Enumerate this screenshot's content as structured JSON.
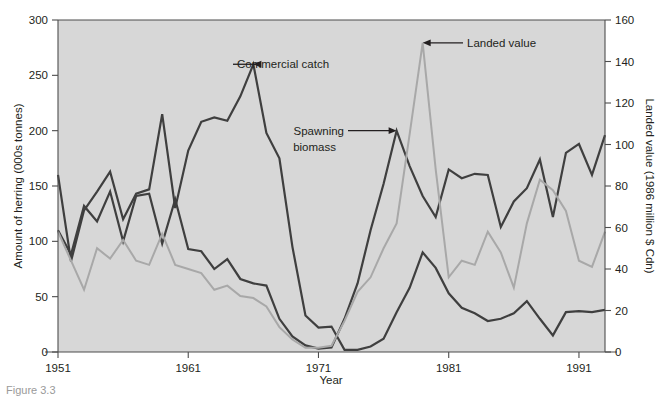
{
  "figure": {
    "caption": "Figure 3.3",
    "plot_bg_color": "#d7d7d7",
    "axis_color": "#4d4d4d"
  },
  "chart_data": {
    "type": "line",
    "title": "",
    "xlabel": "Year",
    "ylabel": "Amount of herring (000s tonnes)",
    "y2label": "Landed value (1986 million $ Cdn)",
    "xlim": [
      1951,
      1993
    ],
    "ylim": [
      0,
      300
    ],
    "y2lim": [
      0,
      160
    ],
    "grid": false,
    "legend": "annotations",
    "xticks": [
      1951,
      1961,
      1971,
      1981,
      1991
    ],
    "xticklabels": [
      "1951",
      "1961",
      "1971",
      "1981",
      "1991"
    ],
    "yticks": [
      0,
      50,
      100,
      150,
      200,
      250,
      300
    ],
    "yticklabels": [
      "0",
      "50",
      "100",
      "150",
      "200",
      "250",
      "300"
    ],
    "y2ticks": [
      0,
      20,
      40,
      60,
      80,
      100,
      120,
      140,
      160
    ],
    "y2ticklabels": [
      "0",
      "20",
      "40",
      "60",
      "80",
      "100",
      "120",
      "140",
      "160"
    ],
    "x": [
      1951,
      1952,
      1953,
      1954,
      1955,
      1956,
      1957,
      1958,
      1959,
      1960,
      1961,
      1962,
      1963,
      1964,
      1965,
      1966,
      1967,
      1968,
      1969,
      1970,
      1971,
      1972,
      1973,
      1974,
      1975,
      1976,
      1977,
      1978,
      1979,
      1980,
      1981,
      1982,
      1983,
      1984,
      1985,
      1986,
      1987,
      1988,
      1989,
      1990,
      1991,
      1992,
      1993
    ],
    "series": [
      {
        "name": "Commercial catch",
        "axis": "left",
        "color": "#3f3f3f",
        "width": 2.2,
        "values": [
          160,
          82,
          128,
          145,
          163,
          120,
          143,
          147,
          215,
          130,
          182,
          208,
          212,
          209,
          231,
          260,
          198,
          175,
          95,
          33,
          22,
          23,
          2,
          2,
          5,
          12,
          36,
          58,
          90,
          76,
          53,
          40,
          35,
          28,
          30,
          35,
          46,
          30,
          15,
          36,
          37,
          36,
          38
        ]
      },
      {
        "name": "Spawning biomass",
        "axis": "left",
        "color": "#3f3f3f",
        "width": 2.2,
        "values": [
          110,
          88,
          132,
          118,
          145,
          100,
          141,
          143,
          98,
          138,
          93,
          91,
          75,
          84,
          66,
          62,
          60,
          30,
          14,
          6,
          3,
          4,
          30,
          62,
          110,
          152,
          200,
          168,
          141,
          122,
          165,
          157,
          161,
          160,
          113,
          136,
          148,
          174,
          122,
          180,
          188,
          160,
          196
        ]
      },
      {
        "name": "Landed value",
        "axis": "right",
        "color": "#a8a8a8",
        "width": 2.0,
        "values": [
          58,
          44,
          30,
          50,
          45,
          54,
          44,
          42,
          57,
          42,
          40,
          38,
          30,
          32,
          27,
          26,
          22,
          12,
          6,
          2,
          2,
          3,
          15,
          29,
          36,
          50,
          62,
          105,
          149,
          88,
          36,
          44,
          42,
          58,
          48,
          31,
          62,
          83,
          78,
          68,
          44,
          41,
          58
        ]
      }
    ],
    "annotations": [
      {
        "text": "Commercial catch",
        "arrow": "left",
        "target_x": 1966,
        "target_y": 260,
        "label_x": 237,
        "label_y": 64
      },
      {
        "text_line1": "Spawning",
        "text_line2": "biomass",
        "arrow": "right",
        "target_x": 1977,
        "target_y": 200,
        "label_x": 275,
        "label_y": 134
      },
      {
        "text": "Landed value",
        "arrow": "left",
        "target_x": 1979,
        "target_y": 149,
        "label_x": 467,
        "label_y": 47
      }
    ]
  }
}
